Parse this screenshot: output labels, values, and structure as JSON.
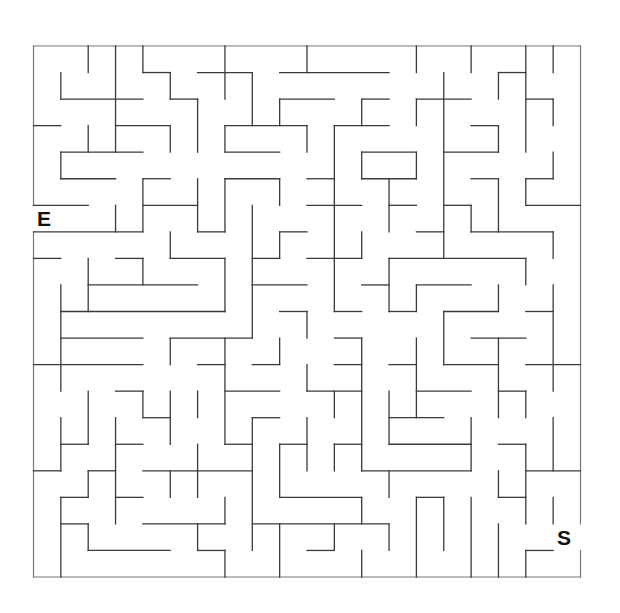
{
  "maze": {
    "grid": {
      "cols": 20,
      "rows": 20,
      "origin_x": 33.5,
      "origin_y": 46,
      "cell_w": 27.35,
      "cell_h": 26.55
    },
    "entry_label": "E",
    "start_label": "S",
    "wall_color": "#3a3a3a",
    "background": "#ffffff",
    "border": [
      [
        0,
        0,
        20,
        0
      ],
      [
        0,
        20,
        20,
        20
      ],
      [
        0,
        0,
        0,
        6
      ],
      [
        0,
        7,
        0,
        20
      ],
      [
        20,
        0,
        20,
        18
      ],
      [
        20,
        19,
        20,
        20
      ]
    ],
    "horizontal": [
      [
        1,
        4,
        5
      ],
      [
        1,
        6,
        8
      ],
      [
        1,
        9,
        13
      ],
      [
        1,
        17,
        18
      ],
      [
        2,
        1,
        4
      ],
      [
        2,
        5,
        6
      ],
      [
        2,
        9,
        11
      ],
      [
        2,
        12,
        13
      ],
      [
        2,
        14,
        16
      ],
      [
        2,
        18,
        19
      ],
      [
        3,
        0,
        1
      ],
      [
        3,
        3,
        5
      ],
      [
        3,
        7,
        10
      ],
      [
        3,
        11,
        13
      ],
      [
        3,
        16,
        17
      ],
      [
        4,
        1,
        4
      ],
      [
        4,
        7,
        9
      ],
      [
        4,
        12,
        14
      ],
      [
        4,
        15,
        17
      ],
      [
        5,
        1,
        3
      ],
      [
        5,
        4,
        5
      ],
      [
        5,
        7,
        9
      ],
      [
        5,
        10,
        11
      ],
      [
        5,
        12,
        14
      ],
      [
        5,
        16,
        17
      ],
      [
        5,
        18,
        19
      ],
      [
        6,
        0,
        2
      ],
      [
        6,
        4,
        6
      ],
      [
        6,
        10,
        12
      ],
      [
        6,
        13,
        14
      ],
      [
        6,
        15,
        16
      ],
      [
        6,
        18,
        20
      ],
      [
        7,
        0,
        4
      ],
      [
        7,
        6,
        7
      ],
      [
        7,
        9,
        10
      ],
      [
        7,
        14,
        15
      ],
      [
        7,
        16,
        19
      ],
      [
        8,
        0,
        1
      ],
      [
        8,
        3,
        4
      ],
      [
        8,
        5,
        7
      ],
      [
        8,
        8,
        9
      ],
      [
        8,
        10,
        12
      ],
      [
        8,
        13,
        18
      ],
      [
        9,
        2,
        6
      ],
      [
        9,
        8,
        10
      ],
      [
        9,
        12,
        13
      ],
      [
        9,
        14,
        16
      ],
      [
        10,
        1,
        7
      ],
      [
        10,
        9,
        10
      ],
      [
        10,
        11,
        12
      ],
      [
        10,
        13,
        14
      ],
      [
        10,
        15,
        17
      ],
      [
        10,
        18,
        19
      ],
      [
        11,
        1,
        4
      ],
      [
        11,
        5,
        8
      ],
      [
        11,
        11,
        12
      ],
      [
        11,
        16,
        18
      ],
      [
        12,
        0,
        4
      ],
      [
        12,
        6,
        7
      ],
      [
        12,
        8,
        9
      ],
      [
        12,
        11,
        12
      ],
      [
        12,
        13,
        14
      ],
      [
        12,
        15,
        17
      ],
      [
        12,
        18,
        20
      ],
      [
        13,
        3,
        4
      ],
      [
        13,
        7,
        9
      ],
      [
        13,
        10,
        12
      ],
      [
        13,
        14,
        16
      ],
      [
        13,
        17,
        18
      ],
      [
        14,
        4,
        5
      ],
      [
        14,
        8,
        9
      ],
      [
        14,
        13,
        15
      ],
      [
        15,
        1,
        2
      ],
      [
        15,
        3,
        4
      ],
      [
        15,
        7,
        8
      ],
      [
        15,
        9,
        10
      ],
      [
        15,
        11,
        12
      ],
      [
        15,
        13,
        16
      ],
      [
        15,
        17,
        18
      ],
      [
        16,
        0,
        1
      ],
      [
        16,
        2,
        3
      ],
      [
        16,
        4,
        8
      ],
      [
        16,
        12,
        16
      ],
      [
        16,
        18,
        20
      ],
      [
        17,
        1,
        2
      ],
      [
        17,
        3,
        4
      ],
      [
        17,
        9,
        12
      ],
      [
        17,
        14,
        15
      ],
      [
        17,
        17,
        18
      ],
      [
        18,
        1,
        2
      ],
      [
        18,
        4,
        7
      ],
      [
        18,
        8,
        13
      ],
      [
        19,
        2,
        5
      ],
      [
        19,
        6,
        7
      ],
      [
        19,
        10,
        11
      ],
      [
        19,
        18,
        19
      ]
    ],
    "vertical": [
      [
        1,
        1,
        2
      ],
      [
        1,
        4,
        5
      ],
      [
        1,
        9,
        13
      ],
      [
        1,
        14,
        16
      ],
      [
        1,
        17,
        20
      ],
      [
        2,
        0,
        1
      ],
      [
        2,
        3,
        4
      ],
      [
        2,
        8,
        10
      ],
      [
        2,
        13,
        15
      ],
      [
        2,
        16,
        17
      ],
      [
        2,
        18,
        19
      ],
      [
        3,
        0,
        4
      ],
      [
        3,
        6,
        7
      ],
      [
        3,
        14,
        18
      ],
      [
        4,
        0,
        1
      ],
      [
        4,
        5,
        7
      ],
      [
        4,
        8,
        9
      ],
      [
        4,
        13,
        14
      ],
      [
        5,
        1,
        2
      ],
      [
        5,
        3,
        4
      ],
      [
        5,
        7,
        8
      ],
      [
        5,
        11,
        12
      ],
      [
        5,
        13,
        15
      ],
      [
        5,
        16,
        17
      ],
      [
        6,
        2,
        4
      ],
      [
        6,
        5,
        7
      ],
      [
        6,
        13,
        14
      ],
      [
        6,
        15,
        17
      ],
      [
        6,
        18,
        19
      ],
      [
        7,
        0,
        2
      ],
      [
        7,
        3,
        4
      ],
      [
        7,
        5,
        7
      ],
      [
        7,
        8,
        10
      ],
      [
        7,
        11,
        15
      ],
      [
        7,
        17,
        18
      ],
      [
        7,
        19,
        20
      ],
      [
        8,
        1,
        3
      ],
      [
        8,
        6,
        11
      ],
      [
        8,
        14,
        19
      ],
      [
        9,
        2,
        3
      ],
      [
        9,
        5,
        6
      ],
      [
        9,
        7,
        8
      ],
      [
        9,
        11,
        12
      ],
      [
        9,
        15,
        17
      ],
      [
        9,
        18,
        20
      ],
      [
        10,
        0,
        1
      ],
      [
        10,
        3,
        4
      ],
      [
        10,
        10,
        11
      ],
      [
        10,
        12,
        13
      ],
      [
        10,
        14,
        16
      ],
      [
        11,
        3,
        10
      ],
      [
        11,
        13,
        14
      ],
      [
        11,
        15,
        16
      ],
      [
        11,
        18,
        19
      ],
      [
        12,
        2,
        3
      ],
      [
        12,
        4,
        5
      ],
      [
        12,
        7,
        8
      ],
      [
        12,
        11,
        16
      ],
      [
        12,
        17,
        18
      ],
      [
        12,
        19,
        20
      ],
      [
        13,
        5,
        7
      ],
      [
        13,
        8,
        10
      ],
      [
        13,
        13,
        15
      ],
      [
        13,
        16,
        17
      ],
      [
        13,
        18,
        19
      ],
      [
        14,
        0,
        1
      ],
      [
        14,
        2,
        3
      ],
      [
        14,
        4,
        5
      ],
      [
        14,
        9,
        10
      ],
      [
        14,
        11,
        14
      ],
      [
        14,
        17,
        20
      ],
      [
        15,
        1,
        8
      ],
      [
        15,
        10,
        12
      ],
      [
        15,
        17,
        19
      ],
      [
        16,
        0,
        1
      ],
      [
        16,
        6,
        7
      ],
      [
        16,
        14,
        16
      ],
      [
        16,
        17,
        20
      ],
      [
        17,
        1,
        2
      ],
      [
        17,
        3,
        4
      ],
      [
        17,
        5,
        7
      ],
      [
        17,
        9,
        10
      ],
      [
        17,
        11,
        14
      ],
      [
        17,
        16,
        17
      ],
      [
        17,
        18,
        20
      ],
      [
        18,
        0,
        4
      ],
      [
        18,
        5,
        6
      ],
      [
        18,
        8,
        9
      ],
      [
        18,
        13,
        14
      ],
      [
        18,
        15,
        18
      ],
      [
        18,
        19,
        20
      ],
      [
        19,
        0,
        1
      ],
      [
        19,
        2,
        3
      ],
      [
        19,
        4,
        5
      ],
      [
        19,
        7,
        8
      ],
      [
        19,
        9,
        13
      ],
      [
        19,
        14,
        16
      ],
      [
        19,
        17,
        18
      ]
    ]
  }
}
